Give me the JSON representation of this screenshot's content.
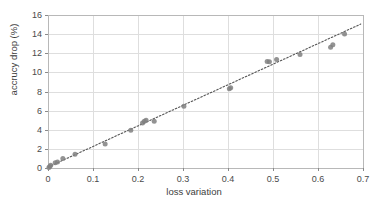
{
  "chart_data": {
    "type": "scatter",
    "title": "",
    "xlabel": "loss variation",
    "ylabel": "accrucy drop (%)",
    "xlim": [
      0,
      0.7
    ],
    "ylim": [
      0,
      16
    ],
    "xticks": [
      "0",
      "0.1",
      "0.2",
      "0.3",
      "0.4",
      "0.5",
      "0.6",
      "0.7"
    ],
    "xtick_values": [
      0,
      0.1,
      0.2,
      0.3,
      0.4,
      0.5,
      0.6,
      0.7
    ],
    "yticks": [
      "0",
      "2",
      "4",
      "6",
      "8",
      "10",
      "12",
      "14",
      "16"
    ],
    "ytick_values": [
      0,
      2,
      4,
      6,
      8,
      10,
      12,
      14,
      16
    ],
    "grid": true,
    "legend": "none",
    "marker": {
      "shape": "circle",
      "color": "#808080",
      "size": 5,
      "opacity": 0.85
    },
    "series": [
      {
        "name": "samples",
        "points": [
          [
            0.002,
            0.05
          ],
          [
            0.004,
            0.15
          ],
          [
            0.006,
            0.3
          ],
          [
            0.016,
            0.55
          ],
          [
            0.021,
            0.62
          ],
          [
            0.033,
            1.0
          ],
          [
            0.06,
            1.45
          ],
          [
            0.127,
            2.5
          ],
          [
            0.184,
            3.95
          ],
          [
            0.21,
            4.7
          ],
          [
            0.214,
            4.9
          ],
          [
            0.218,
            5.0
          ],
          [
            0.236,
            4.88
          ],
          [
            0.302,
            6.45
          ],
          [
            0.403,
            8.3
          ],
          [
            0.406,
            8.4
          ],
          [
            0.487,
            11.15
          ],
          [
            0.492,
            11.1
          ],
          [
            0.508,
            11.35
          ],
          [
            0.56,
            11.88
          ],
          [
            0.628,
            12.62
          ],
          [
            0.633,
            12.9
          ],
          [
            0.659,
            14.02
          ]
        ]
      }
    ],
    "trendline": {
      "style": "dotted",
      "color": "#555555",
      "x_start": 0.0,
      "y_start": 0.1,
      "x_end": 0.695,
      "y_end": 15.05
    }
  },
  "plot_geometry": {
    "left": 48,
    "right": 363,
    "top": 15,
    "bottom": 168
  }
}
